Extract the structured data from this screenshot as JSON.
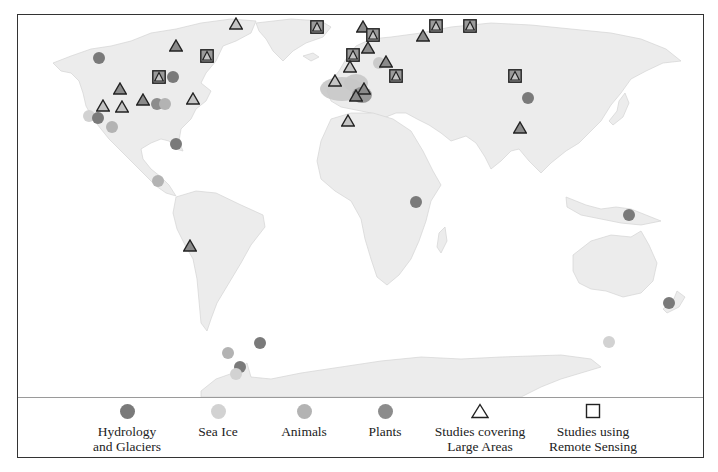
{
  "figure": {
    "type": "world-map",
    "colors": {
      "land": "#ececec",
      "coast": "#d4d4d4",
      "hydrology": "#7a7a7a",
      "sea_ice": "#d2d2d2",
      "animals": "#b3b3b3",
      "plants": "#8c8c8c",
      "region_light": "#c8c8c8",
      "region_dark": "#8f8f8f",
      "marker_outline": "#222222"
    }
  },
  "legend": {
    "items": [
      {
        "key": "hydrology",
        "symbol": "circle",
        "label": "Hydrology\nand Glaciers",
        "x": 109
      },
      {
        "key": "sea_ice",
        "symbol": "circle",
        "label": "Sea Ice",
        "x": 200
      },
      {
        "key": "animals",
        "symbol": "circle",
        "label": "Animals",
        "x": 286
      },
      {
        "key": "plants",
        "symbol": "circle",
        "label": "Plants",
        "x": 367
      },
      {
        "key": "large_areas",
        "symbol": "triangle",
        "label": "Studies covering\nLarge Areas",
        "x": 462
      },
      {
        "key": "remote_sensing",
        "symbol": "square",
        "label": "Studies using\nRemote Sensing",
        "x": 575
      }
    ]
  },
  "regions": [
    {
      "name": "western-europe-region",
      "shade": "light",
      "cx": 341,
      "cy": 88,
      "rx": 22,
      "ry": 12
    },
    {
      "name": "central-europe-region",
      "shade": "light",
      "cx": 355,
      "cy": 82,
      "rx": 12,
      "ry": 9
    },
    {
      "name": "alps-region",
      "shade": "dark",
      "cx": 361,
      "cy": 94,
      "rx": 10,
      "ry": 8
    },
    {
      "name": "scandinavia-region",
      "shade": "light",
      "cx": 378,
      "cy": 62,
      "rx": 6,
      "ry": 6
    }
  ],
  "markers": [
    {
      "location": "alaska",
      "type": "circle",
      "category": "hydrology",
      "x": 99,
      "y": 58
    },
    {
      "location": "arctic-canada-north",
      "type": "triangle",
      "filled": "dark",
      "x": 176,
      "y": 46
    },
    {
      "location": "ellesmere-island",
      "type": "triangle",
      "filled": "light",
      "x": 236,
      "y": 24
    },
    {
      "location": "baffin-island",
      "type": "square-triangle",
      "x": 207,
      "y": 56
    },
    {
      "location": "hudson-bay-west",
      "type": "square-triangle",
      "x": 159,
      "y": 77
    },
    {
      "location": "hudson-bay-east",
      "type": "circle",
      "category": "hydrology",
      "x": 173,
      "y": 77
    },
    {
      "location": "canada-rockies",
      "type": "triangle",
      "filled": "dark",
      "x": 120,
      "y": 89
    },
    {
      "location": "canada-prairie",
      "type": "triangle",
      "filled": "dark",
      "x": 143,
      "y": 100
    },
    {
      "location": "great-lakes-plants",
      "type": "circle",
      "category": "plants",
      "x": 157,
      "y": 104
    },
    {
      "location": "great-lakes-animals",
      "type": "circle",
      "category": "animals",
      "x": 165,
      "y": 104
    },
    {
      "location": "us-northeast",
      "type": "triangle",
      "filled": "light",
      "x": 193,
      "y": 99
    },
    {
      "location": "pacific-northwest",
      "type": "triangle",
      "filled": "light",
      "x": 103,
      "y": 106
    },
    {
      "location": "us-rockies",
      "type": "triangle",
      "filled": "light",
      "x": 122,
      "y": 107
    },
    {
      "location": "california-coast-sea-ice",
      "type": "circle",
      "category": "sea_ice",
      "x": 89,
      "y": 116
    },
    {
      "location": "california-coast-hydrology",
      "type": "circle",
      "category": "hydrology",
      "x": 98,
      "y": 118
    },
    {
      "location": "us-southwest",
      "type": "circle",
      "category": "animals",
      "x": 112,
      "y": 127
    },
    {
      "location": "florida",
      "type": "circle",
      "category": "hydrology",
      "x": 176,
      "y": 144
    },
    {
      "location": "central-america",
      "type": "circle",
      "category": "animals",
      "x": 158,
      "y": 181
    },
    {
      "location": "peru-andes",
      "type": "triangle",
      "filled": "dark",
      "x": 190,
      "y": 246
    },
    {
      "location": "south-orkney",
      "type": "circle",
      "category": "hydrology",
      "x": 260,
      "y": 343
    },
    {
      "location": "antarctic-peninsula-animals",
      "type": "circle",
      "category": "animals",
      "x": 228,
      "y": 353
    },
    {
      "location": "antarctic-peninsula-hydrology",
      "type": "circle",
      "category": "hydrology",
      "x": 240,
      "y": 367
    },
    {
      "location": "antarctic-peninsula-sea-ice",
      "type": "circle",
      "category": "sea_ice",
      "x": 236,
      "y": 374
    },
    {
      "location": "east-greenland",
      "type": "square-triangle",
      "x": 317,
      "y": 27
    },
    {
      "location": "svalbard",
      "type": "triangle",
      "filled": "dark",
      "x": 363,
      "y": 27
    },
    {
      "location": "barents-sea",
      "type": "square-triangle",
      "x": 373,
      "y": 35
    },
    {
      "location": "novaya-zemlya",
      "type": "triangle",
      "filled": "dark",
      "x": 423,
      "y": 36
    },
    {
      "location": "kara-sea",
      "type": "square-triangle",
      "x": 436,
      "y": 26
    },
    {
      "location": "laptev-sea",
      "type": "square-triangle",
      "x": 470,
      "y": 26
    },
    {
      "location": "norway-north",
      "type": "square-triangle",
      "x": 353,
      "y": 55
    },
    {
      "location": "sweden-north",
      "type": "triangle",
      "filled": "dark",
      "x": 368,
      "y": 48
    },
    {
      "location": "finland",
      "type": "triangle",
      "filled": "dark",
      "x": 386,
      "y": 62
    },
    {
      "location": "norway-south",
      "type": "triangle",
      "filled": "light",
      "x": 350,
      "y": 67
    },
    {
      "location": "western-russia",
      "type": "square-triangle",
      "x": 396,
      "y": 76
    },
    {
      "location": "britain",
      "type": "triangle",
      "filled": "light",
      "x": 335,
      "y": 81
    },
    {
      "location": "central-europe",
      "type": "triangle",
      "filled": "dark",
      "x": 364,
      "y": 89
    },
    {
      "location": "alps",
      "type": "triangle",
      "filled": "dark",
      "x": 356,
      "y": 96
    },
    {
      "location": "north-africa",
      "type": "triangle",
      "filled": "light",
      "x": 348,
      "y": 121
    },
    {
      "location": "siberia",
      "type": "square-triangle",
      "x": 515,
      "y": 76
    },
    {
      "location": "mongolia",
      "type": "circle",
      "category": "hydrology",
      "x": 528,
      "y": 98
    },
    {
      "location": "tibet",
      "type": "triangle",
      "filled": "dark",
      "x": 520,
      "y": 128
    },
    {
      "location": "east-africa",
      "type": "circle",
      "category": "hydrology",
      "x": 416,
      "y": 202
    },
    {
      "location": "new-guinea",
      "type": "circle",
      "category": "hydrology",
      "x": 629,
      "y": 215
    },
    {
      "location": "new-zealand",
      "type": "circle",
      "category": "hydrology",
      "x": 669,
      "y": 303
    },
    {
      "location": "southern-ocean",
      "type": "circle",
      "category": "sea_ice",
      "x": 609,
      "y": 342
    }
  ]
}
